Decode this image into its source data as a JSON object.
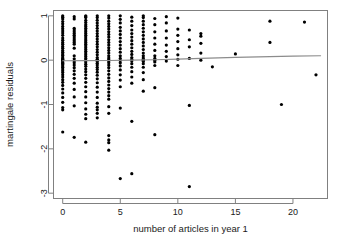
{
  "chart_data": {
    "type": "scatter",
    "title": "",
    "subtitle": "",
    "xlabel": "number of articles in year 1",
    "ylabel": "martingale residuals",
    "xlim": [
      -0.8,
      23.0
    ],
    "ylim": [
      -3.12,
      1.12
    ],
    "xticks": [
      0,
      5,
      10,
      15,
      20
    ],
    "yticks": [
      1,
      0,
      -1,
      -2,
      -3
    ],
    "xtick_labels": [
      "0",
      "5",
      "10",
      "15",
      "20"
    ],
    "ytick_labels": [
      "1",
      "0",
      "-1",
      "-2",
      "-3"
    ],
    "grid": false,
    "legend": null,
    "point_color": "#000000",
    "point_symbol": "filled-circle",
    "point_radius": 1.6,
    "frame_color": "#808080",
    "axis_color": "#808080",
    "series": [
      {
        "name": "martingale residuals",
        "type": "scatter",
        "x": [
          0,
          0,
          0,
          0,
          0,
          0,
          0,
          0,
          0,
          0,
          0,
          0,
          0,
          0,
          0,
          0,
          0,
          0,
          0,
          0,
          0,
          0,
          0,
          0,
          0,
          0,
          0,
          0,
          0,
          0,
          0,
          0,
          0,
          0,
          0,
          0,
          0,
          0,
          0,
          0,
          0,
          0,
          0,
          0,
          0,
          1,
          1,
          1,
          1,
          1,
          1,
          1,
          1,
          1,
          1,
          1,
          1,
          1,
          1,
          1,
          1,
          1,
          1,
          1,
          1,
          1,
          1,
          1,
          1,
          1,
          1,
          1,
          2,
          2,
          2,
          2,
          2,
          2,
          2,
          2,
          2,
          2,
          2,
          2,
          2,
          2,
          2,
          2,
          2,
          2,
          2,
          2,
          2,
          2,
          2,
          2,
          2,
          2,
          2,
          2,
          2,
          2,
          2,
          2,
          2,
          2,
          2,
          2,
          2,
          2,
          2,
          2,
          2,
          2,
          3,
          3,
          3,
          3,
          3,
          3,
          3,
          3,
          3,
          3,
          3,
          3,
          3,
          3,
          3,
          3,
          3,
          3,
          3,
          3,
          3,
          3,
          3,
          3,
          3,
          3,
          3,
          3,
          3,
          3,
          3,
          3,
          3,
          3,
          3,
          3,
          4,
          4,
          4,
          4,
          4,
          4,
          4,
          4,
          4,
          4,
          4,
          4,
          4,
          4,
          4,
          4,
          4,
          4,
          4,
          4,
          4,
          4,
          4,
          4,
          4,
          4,
          4,
          4,
          4,
          4,
          4,
          4,
          4,
          4,
          4,
          4,
          4,
          5,
          5,
          5,
          5,
          5,
          5,
          5,
          5,
          5,
          5,
          5,
          5,
          5,
          5,
          5,
          5,
          5,
          5,
          5,
          5,
          5,
          5,
          6,
          6,
          6,
          6,
          6,
          6,
          6,
          6,
          6,
          6,
          6,
          6,
          6,
          6,
          6,
          6,
          6,
          6,
          6,
          6,
          6,
          7,
          7,
          7,
          7,
          7,
          7,
          7,
          7,
          7,
          7,
          7,
          7,
          7,
          7,
          7,
          7,
          7,
          7,
          7,
          7,
          7,
          7,
          8,
          8,
          8,
          8,
          8,
          8,
          8,
          8,
          8,
          8,
          8,
          8,
          8,
          9,
          9,
          9,
          9,
          9,
          9,
          9,
          9,
          10,
          10,
          10,
          10,
          10,
          10,
          10,
          10,
          11,
          11,
          11,
          11,
          11,
          11,
          12,
          12,
          12,
          12,
          12,
          13,
          15,
          18,
          18,
          19,
          21,
          22
        ],
        "y": [
          1.0,
          0.97,
          0.93,
          0.87,
          0.82,
          0.76,
          0.71,
          0.66,
          0.61,
          0.56,
          0.5,
          0.45,
          0.4,
          0.36,
          0.31,
          0.27,
          0.22,
          0.18,
          0.14,
          0.11,
          0.07,
          0.04,
          0.02,
          0.0,
          -0.02,
          -0.05,
          -0.07,
          -0.1,
          -0.13,
          -0.16,
          -0.2,
          -0.24,
          -0.28,
          -0.33,
          -0.38,
          -0.44,
          -0.5,
          -0.57,
          -0.65,
          -0.74,
          -0.84,
          -0.95,
          -1.07,
          -1.12,
          -1.62,
          0.98,
          0.93,
          0.72,
          0.68,
          0.64,
          0.6,
          0.56,
          0.52,
          0.48,
          0.44,
          0.4,
          0.36,
          0.27,
          0.1,
          0.03,
          -0.02,
          -0.06,
          -0.11,
          -0.17,
          -0.24,
          -0.32,
          -0.41,
          -0.52,
          -0.66,
          -0.83,
          -1.03,
          -1.74,
          1.0,
          0.98,
          0.96,
          0.9,
          0.85,
          0.8,
          0.76,
          0.72,
          0.68,
          0.64,
          0.6,
          0.56,
          0.52,
          0.48,
          0.44,
          0.4,
          0.36,
          0.32,
          0.28,
          0.24,
          0.2,
          0.16,
          0.12,
          0.08,
          0.04,
          0.0,
          -0.04,
          -0.09,
          -0.14,
          -0.2,
          -0.26,
          -0.33,
          -0.41,
          -0.5,
          -0.6,
          -0.71,
          -0.83,
          -0.96,
          -1.1,
          -1.22,
          -1.32,
          -1.85,
          1.0,
          0.96,
          0.9,
          0.84,
          0.78,
          0.72,
          0.66,
          0.6,
          0.54,
          0.48,
          0.42,
          0.36,
          0.3,
          0.24,
          0.18,
          0.12,
          0.06,
          0.02,
          0.0,
          -0.03,
          -0.07,
          -0.11,
          -0.16,
          -0.21,
          -0.27,
          -0.34,
          -0.42,
          -0.51,
          -0.61,
          -0.72,
          -0.84,
          -0.97,
          -1.06,
          -1.12,
          -1.2,
          -1.3,
          1.0,
          0.95,
          0.88,
          0.82,
          0.76,
          0.7,
          0.64,
          0.58,
          0.52,
          0.46,
          0.4,
          0.34,
          0.28,
          0.22,
          0.16,
          0.1,
          0.05,
          0.01,
          -0.02,
          -0.06,
          -0.11,
          -0.17,
          -0.24,
          -0.32,
          -0.4,
          -0.48,
          -0.56,
          -0.64,
          -0.72,
          -0.8,
          -0.88,
          -1.05,
          -1.2,
          -1.7,
          -1.8,
          -1.86,
          -2.03,
          1.0,
          0.92,
          0.84,
          0.74,
          0.66,
          0.58,
          0.5,
          0.42,
          0.34,
          0.26,
          0.18,
          0.1,
          0.04,
          -0.01,
          -0.06,
          -0.13,
          -0.22,
          -0.33,
          -0.45,
          -0.6,
          -1.08,
          -2.67,
          0.97,
          0.88,
          0.78,
          0.68,
          0.6,
          0.52,
          0.44,
          0.36,
          0.28,
          0.2,
          0.13,
          0.06,
          0.02,
          -0.02,
          -0.08,
          -0.16,
          -0.26,
          -0.38,
          -0.52,
          -1.38,
          -2.56,
          1.0,
          0.96,
          0.88,
          0.8,
          0.72,
          0.64,
          0.56,
          0.48,
          0.4,
          0.32,
          0.24,
          0.16,
          0.1,
          0.05,
          0.02,
          0.0,
          -0.03,
          -0.08,
          -0.16,
          -0.28,
          -0.44,
          -0.7,
          0.94,
          0.8,
          0.64,
          0.5,
          0.36,
          0.22,
          0.1,
          0.04,
          0.0,
          -0.04,
          -0.12,
          -0.62,
          -1.68,
          0.98,
          0.84,
          0.66,
          0.5,
          0.34,
          0.2,
          0.08,
          -0.02,
          0.95,
          0.7,
          0.56,
          0.42,
          0.26,
          0.12,
          0.02,
          -0.12,
          0.68,
          0.46,
          0.3,
          0.04,
          -1.02,
          -2.85,
          0.6,
          0.54,
          0.38,
          0.16,
          0.0,
          -0.15,
          0.14,
          0.88,
          0.4,
          -1.0,
          0.86,
          -0.33
        ],
        "n_points": 291
      },
      {
        "name": "smoother",
        "type": "line",
        "color": "#8c8c8c",
        "line_width": 1.1,
        "x": [
          0,
          2,
          4,
          6,
          8,
          10,
          12,
          15,
          18,
          20,
          22.4
        ],
        "y": [
          -0.012,
          -0.01,
          -0.006,
          0.0,
          0.01,
          0.024,
          0.04,
          0.062,
          0.08,
          0.09,
          0.1
        ]
      }
    ]
  }
}
